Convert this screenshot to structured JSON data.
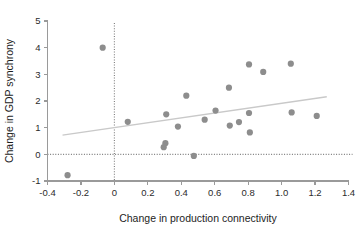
{
  "chart_data": {
    "type": "scatter",
    "title": "",
    "xlabel": "Change in production connectivity",
    "ylabel": "Change in GDP synchrony",
    "xlim": [
      -0.4,
      1.4
    ],
    "ylim": [
      -1,
      5
    ],
    "xticks": [
      -0.4,
      -0.2,
      0,
      0.2,
      0.4,
      0.6,
      0.8,
      1.0,
      1.2,
      1.4
    ],
    "xticklabels": [
      "-0.4",
      "-0.2",
      "0",
      "0.2",
      "0.4",
      "0.6",
      "0.8",
      "1.0",
      "1.2",
      "1.4"
    ],
    "yticks": [
      -1,
      0,
      1,
      2,
      3,
      4,
      5
    ],
    "yticklabels": [
      "-1",
      "0",
      "1",
      "2",
      "3",
      "4",
      "5"
    ],
    "grid": false,
    "legend": "none",
    "marker_color": "#8d8d8d",
    "fit_line_color": "#c9c9c9",
    "reference_line_color": "#7d7d7d",
    "axis_color": "#9a9a9a",
    "points": [
      {
        "x": -0.28,
        "y": -0.78
      },
      {
        "x": -0.07,
        "y": 4.0
      },
      {
        "x": 0.08,
        "y": 1.22
      },
      {
        "x": 0.295,
        "y": 0.27
      },
      {
        "x": 0.305,
        "y": 0.42
      },
      {
        "x": 0.31,
        "y": 1.5
      },
      {
        "x": 0.38,
        "y": 1.04
      },
      {
        "x": 0.43,
        "y": 2.2
      },
      {
        "x": 0.475,
        "y": -0.06
      },
      {
        "x": 0.54,
        "y": 1.3
      },
      {
        "x": 0.605,
        "y": 1.64
      },
      {
        "x": 0.685,
        "y": 2.5
      },
      {
        "x": 0.69,
        "y": 1.08
      },
      {
        "x": 0.745,
        "y": 1.21
      },
      {
        "x": 0.805,
        "y": 3.37
      },
      {
        "x": 0.805,
        "y": 1.55
      },
      {
        "x": 0.81,
        "y": 0.82
      },
      {
        "x": 0.89,
        "y": 3.09
      },
      {
        "x": 1.055,
        "y": 3.4
      },
      {
        "x": 1.06,
        "y": 1.57
      },
      {
        "x": 1.21,
        "y": 1.44
      }
    ],
    "fit_line": {
      "x0": -0.31,
      "y0": 0.72,
      "x1": 1.27,
      "y1": 2.16
    },
    "reference_lines": [
      {
        "orientation": "horizontal",
        "value": 0
      },
      {
        "orientation": "vertical",
        "value": 0
      }
    ]
  }
}
